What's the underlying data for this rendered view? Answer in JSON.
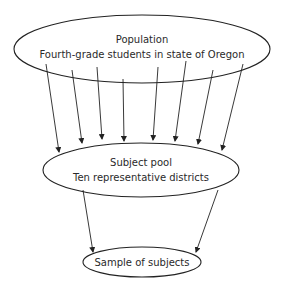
{
  "diagram": {
    "type": "sampling-funnel",
    "nodes": [
      {
        "id": "population",
        "title": "Population",
        "subtitle": "Fourth-grade students in state of Oregon"
      },
      {
        "id": "subject_pool",
        "title": "Subject pool",
        "subtitle": "Ten representative districts"
      },
      {
        "id": "sample",
        "title": "Sample of subjects",
        "subtitle": ""
      }
    ],
    "edges": [
      {
        "from": "population",
        "to": "subject_pool",
        "count": 8
      },
      {
        "from": "subject_pool",
        "to": "sample",
        "count": 2
      }
    ],
    "colors": {
      "stroke": "#222222",
      "text": "#2a2a2a",
      "background": "#ffffff"
    }
  }
}
